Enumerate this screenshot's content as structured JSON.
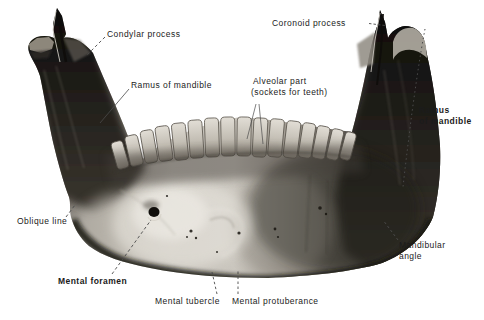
{
  "labels": {
    "condylar_process": "Condylar process",
    "coronoid_process": "Coronoid process",
    "ramus_left": "Ramus of mandible",
    "alveolar_line1": "Alveolar part",
    "alveolar_line2": "(sockets for teeth)",
    "ramus_right_line1": "Ramus",
    "ramus_right_line2": "of mandible",
    "oblique_line": "Oblique line",
    "mental_foramen": "Mental foramen",
    "mental_tubercle": "Mental tubercle",
    "mental_protuberance": "Mental protuberance",
    "mandibular_angle_line1": "Mandibular",
    "mandibular_angle_line2": "angle"
  },
  "colors": {
    "background": "#ffffff",
    "label_text": "#1b1b1b",
    "leader_line": "#4a4a4a",
    "bone_dark": "#141210",
    "bone_light": "#cac6be"
  }
}
